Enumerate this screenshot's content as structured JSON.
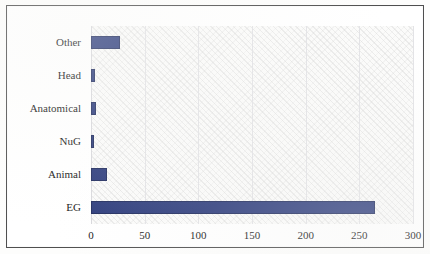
{
  "chart_data": {
    "type": "bar",
    "orientation": "horizontal",
    "title": "",
    "xlabel": "",
    "ylabel": "",
    "categories": [
      "Other",
      "Head",
      "Anatomical",
      "NuG",
      "Animal",
      "EG"
    ],
    "values": [
      27,
      4,
      5,
      3,
      15,
      265
    ],
    "xlim": [
      0,
      300
    ],
    "xticks": [
      0,
      50,
      100,
      150,
      200,
      250,
      300
    ],
    "xtick_labels": [
      "0",
      "50",
      "100",
      "150",
      "200",
      "250",
      "300"
    ],
    "grid": true,
    "grid_axis": "x",
    "legend": false,
    "bar_color": "#2d3c7c",
    "bar_edge_color": "#1f2b5e",
    "plot_background": "#fbfbfa",
    "frame_color": "#4a4a4a"
  }
}
